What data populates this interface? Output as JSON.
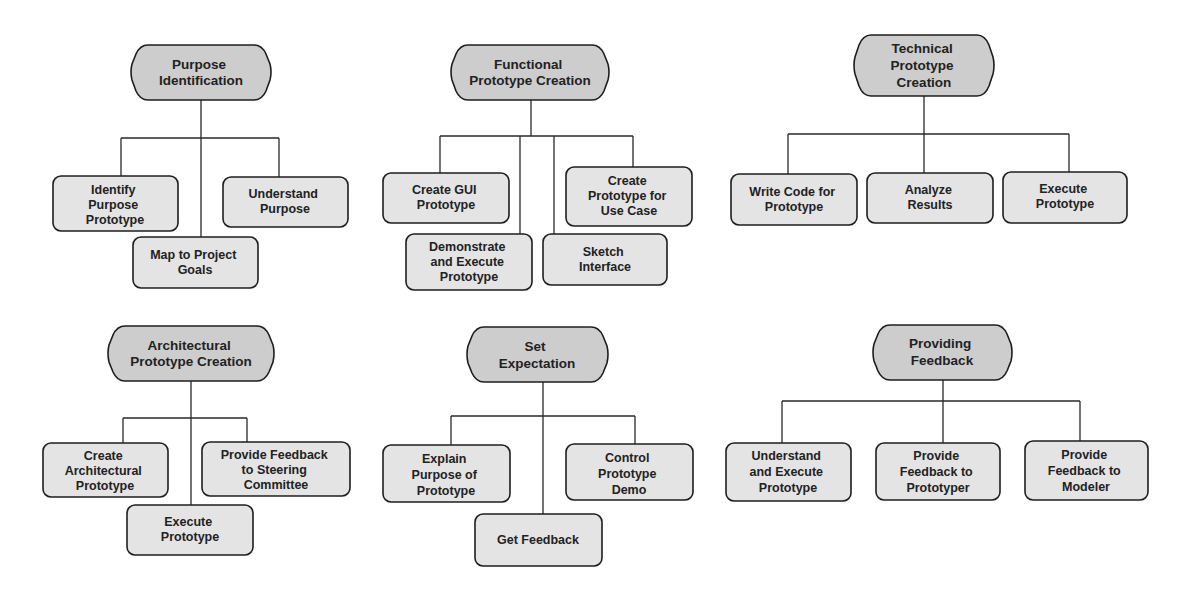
{
  "colors": {
    "root_fill": "#cdcdcd",
    "child_fill": "#e4e4e4",
    "stroke": "#1e1e1e",
    "background": "#ffffff"
  },
  "diagrams": [
    {
      "root": {
        "lines": [
          "Purpose",
          "Identification"
        ]
      },
      "children": [
        {
          "lines": [
            "Identify",
            "Purpose",
            "Prototype"
          ]
        },
        {
          "lines": [
            "Map to Project",
            "Goals"
          ]
        },
        {
          "lines": [
            "Understand",
            "Purpose"
          ]
        }
      ]
    },
    {
      "root": {
        "lines": [
          "Functional",
          "Prototype Creation"
        ]
      },
      "children": [
        {
          "lines": [
            "Create GUI",
            "Prototype"
          ]
        },
        {
          "lines": [
            "Demonstrate",
            "and Execute",
            "Prototype"
          ]
        },
        {
          "lines": [
            "Sketch",
            "Interface"
          ]
        },
        {
          "lines": [
            "Create",
            "Prototype for",
            "Use Case"
          ]
        }
      ]
    },
    {
      "root": {
        "lines": [
          "Technical",
          "Prototype",
          "Creation"
        ]
      },
      "children": [
        {
          "lines": [
            "Write Code for",
            "Prototype"
          ]
        },
        {
          "lines": [
            "Analyze",
            "Results"
          ]
        },
        {
          "lines": [
            "Execute",
            "Prototype"
          ]
        }
      ]
    },
    {
      "root": {
        "lines": [
          "Architectural",
          "Prototype Creation"
        ]
      },
      "children": [
        {
          "lines": [
            "Create",
            "Architectural",
            "Prototype"
          ]
        },
        {
          "lines": [
            "Execute",
            "Prototype"
          ]
        },
        {
          "lines": [
            "Provide Feedback",
            "to Steering",
            "Committee"
          ]
        }
      ]
    },
    {
      "root": {
        "lines": [
          "Set",
          "Expectation"
        ]
      },
      "children": [
        {
          "lines": [
            "Explain",
            "Purpose of",
            "Prototype"
          ]
        },
        {
          "lines": [
            "Get Feedback"
          ]
        },
        {
          "lines": [
            "Control",
            "Prototype",
            "Demo"
          ]
        }
      ]
    },
    {
      "root": {
        "lines": [
          "Providing",
          "Feedback"
        ]
      },
      "children": [
        {
          "lines": [
            "Understand",
            "and Execute",
            "Prototype"
          ]
        },
        {
          "lines": [
            "Provide",
            "Feedback to",
            "Prototyper"
          ]
        },
        {
          "lines": [
            "Provide",
            "Feedback to",
            "Modeler"
          ]
        }
      ]
    }
  ]
}
